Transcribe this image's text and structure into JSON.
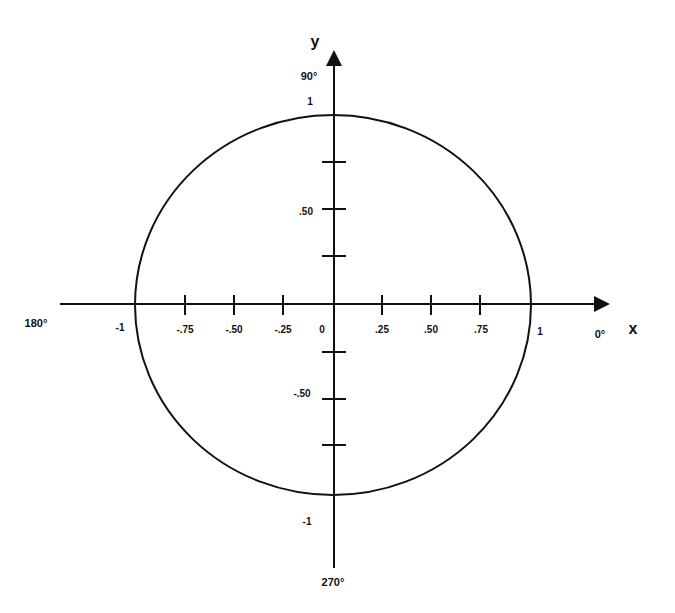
{
  "colors": {
    "stroke": "#111111",
    "background": "#ffffff"
  },
  "geometry": {
    "cx": 333,
    "cy": 305,
    "rx": 198,
    "ry": 190,
    "x_axis": {
      "y": 304,
      "x1": 60,
      "x2": 610
    },
    "y_axis": {
      "x": 334,
      "y1": 50,
      "y2": 568
    }
  },
  "axes": {
    "x": {
      "name": "x",
      "pos_degree": "0°",
      "neg_degree": "180°"
    },
    "y": {
      "name": "y",
      "pos_degree": "90°",
      "neg_degree": "270°"
    }
  },
  "x_ticks": [
    {
      "value": -1,
      "label": "-1"
    },
    {
      "value": -0.75,
      "label": "-.75"
    },
    {
      "value": -0.5,
      "label": "-.50"
    },
    {
      "value": -0.25,
      "label": "-.25"
    },
    {
      "value": 0,
      "label": "0"
    },
    {
      "value": 0.25,
      "label": ".25"
    },
    {
      "value": 0.5,
      "label": ".50"
    },
    {
      "value": 0.75,
      "label": ".75"
    },
    {
      "value": 1,
      "label": "1"
    }
  ],
  "y_ticks": [
    {
      "value": 1,
      "label": "1"
    },
    {
      "value": 0.75,
      "label": ""
    },
    {
      "value": 0.5,
      "label": ".50"
    },
    {
      "value": 0.25,
      "label": ""
    },
    {
      "value": -0.25,
      "label": ""
    },
    {
      "value": -0.5,
      "label": "-.50"
    },
    {
      "value": -0.75,
      "label": ""
    },
    {
      "value": -1,
      "label": "-1"
    }
  ]
}
